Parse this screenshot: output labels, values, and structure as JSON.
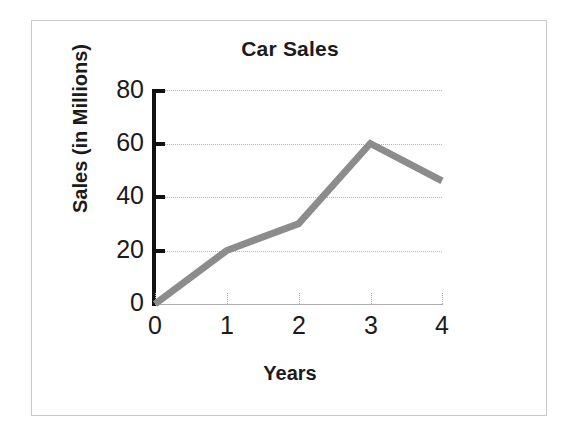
{
  "chart_data": {
    "type": "line",
    "title": "Car Sales",
    "xlabel": "Years",
    "ylabel": "Sales (in Millions)",
    "x": [
      0,
      1,
      2,
      3,
      4
    ],
    "values": [
      0,
      20,
      30,
      60,
      46
    ],
    "series": [
      {
        "name": "Car Sales",
        "values": [
          0,
          20,
          30,
          60,
          46
        ]
      }
    ],
    "xtick_labels": [
      "0",
      "1",
      "2",
      "3",
      "4"
    ],
    "ytick_labels": [
      "0",
      "20",
      "40",
      "60",
      "80"
    ],
    "xlim": [
      0,
      4
    ],
    "ylim": [
      0,
      80
    ],
    "grid": true,
    "legend": false,
    "markers": false,
    "line_color": "#8c8c8c",
    "axis_color": "#111111",
    "grid_color": "#b4b4b4",
    "text_color": "#1b1b1b",
    "border_color": "#c9c9c9",
    "background": "#ffffff"
  }
}
